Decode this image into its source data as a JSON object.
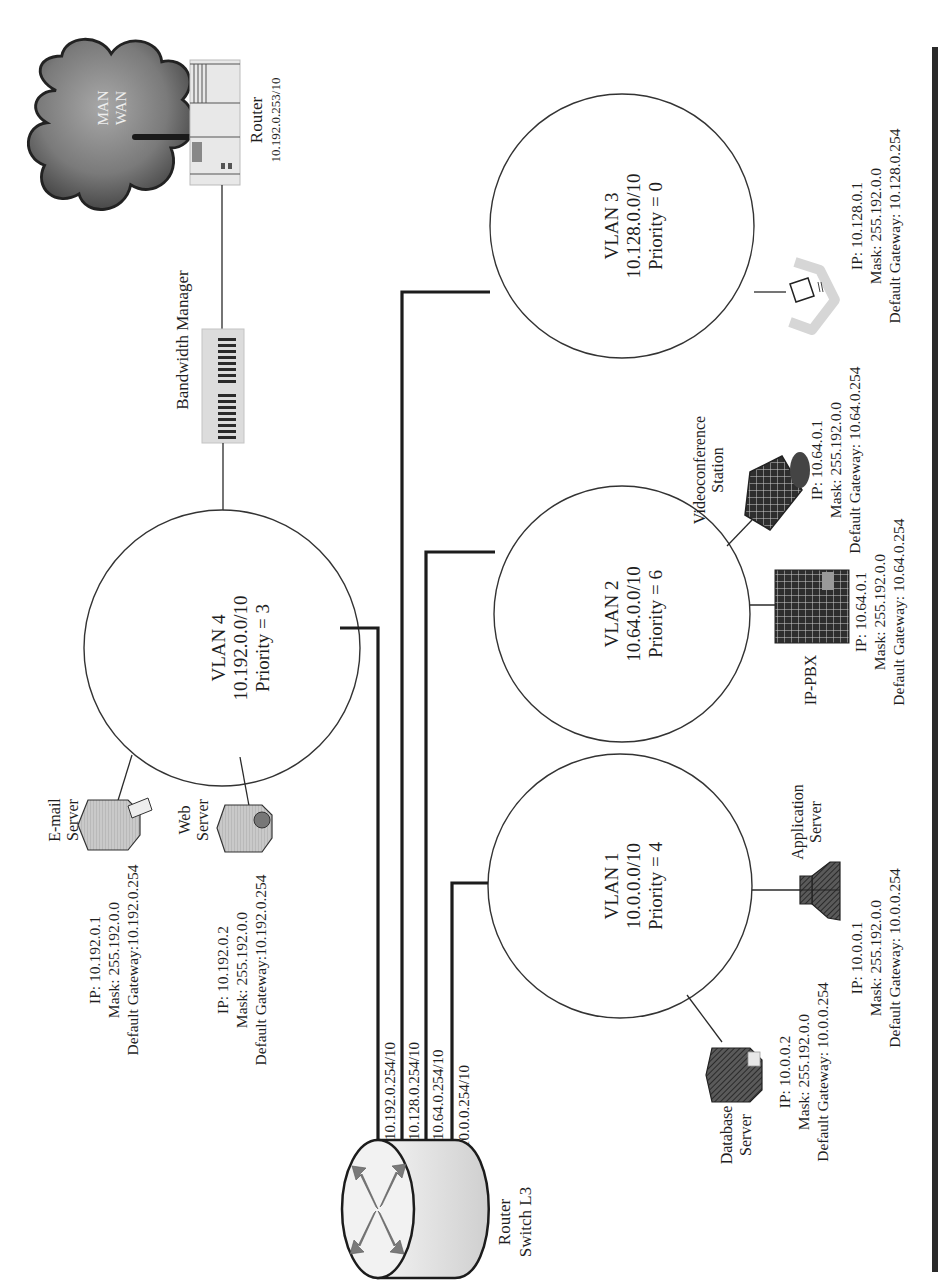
{
  "colors": {
    "line": "#1c1c1c",
    "cloud_dark": "#4a4a4a",
    "cloud_light": "#9a9a9a",
    "device_gray": "#bdbdbd",
    "device_dark": "#3c3c3c",
    "router_fill": "#e6e6e6",
    "arrow_gray": "#7a7a7a"
  },
  "wan": {
    "cloud_label_1": "MAN",
    "cloud_label_2": "WAN",
    "icon": "cloud-icon"
  },
  "edge_router": {
    "name": "Router",
    "ip": "10.192.0.253/10",
    "icon": "router-rack-icon"
  },
  "bandwidth_manager": {
    "name": "Bandwidth Manager",
    "icon": "bandwidth-manager-icon"
  },
  "core_router": {
    "name_line1": "Router",
    "name_line2": "Switch L3",
    "icon": "layer3-switch-icon",
    "ports": [
      {
        "label": "10.192.0.254/10",
        "vlan": "VLAN 4"
      },
      {
        "label": "10.128.0.254/10",
        "vlan": "VLAN 3"
      },
      {
        "label": "10.64.0.254/10",
        "vlan": "VLAN 2"
      },
      {
        "label": "10.0.0.254/10",
        "vlan": "VLAN 1"
      }
    ]
  },
  "vlans": [
    {
      "name": "VLAN 4",
      "network": "10.192.0.0/10",
      "priority": "Priority = 3",
      "devices": [
        {
          "name_line1": "E-mail",
          "name_line2": "Server",
          "icon": "email-server-icon",
          "ip": "IP: 10.192.0.1",
          "mask": "Mask: 255.192.0.0",
          "gateway": "Default Gateway:10.192.0.254"
        },
        {
          "name_line1": "Web",
          "name_line2": "Server",
          "icon": "web-server-icon",
          "ip": "IP: 10.192.0.2",
          "mask": "Mask: 255.192.0.0",
          "gateway": "Default Gateway:10.192.0.254"
        }
      ]
    },
    {
      "name": "VLAN 3",
      "network": "10.128.0.0/10",
      "priority": "Priority = 0",
      "devices": [
        {
          "name_line1": "",
          "name_line2": "",
          "icon": "workstation-icon",
          "ip": "IP: 10.128.0.1",
          "mask": "Mask: 255.192.0.0",
          "gateway": "Default Gateway: 10.128.0.254"
        }
      ]
    },
    {
      "name": "VLAN 2",
      "network": "10.64.0.0/10",
      "priority": "Priority = 6",
      "devices": [
        {
          "name_line1": "IP-PBX",
          "name_line2": "",
          "icon": "ip-pbx-icon",
          "ip": "IP: 10.64.0.1",
          "mask": "Mask: 255.192.0.0",
          "gateway": "Default Gateway: 10.64.0.254"
        },
        {
          "name_line1": "Videoconference",
          "name_line2": "Station",
          "icon": "videoconference-icon",
          "ip": "IP: 10.64.0.1",
          "mask": "Mask: 255.192.0.0",
          "gateway": "Default Gateway: 10.64.0.254"
        }
      ]
    },
    {
      "name": "VLAN 1",
      "network": "10.0.0.0/10",
      "priority": "Priority = 4",
      "devices": [
        {
          "name_line1": "Database",
          "name_line2": "Server",
          "icon": "database-server-icon",
          "ip": "IP: 10.0.0.2",
          "mask": "Mask: 255.192.0.0",
          "gateway": "Default Gateway: 10.0.0.254"
        },
        {
          "name_line1": "Application",
          "name_line2": "Server",
          "icon": "application-server-icon",
          "ip": "IP: 10.0.0.1",
          "mask": "Mask: 255.192.0.0",
          "gateway": "Default Gateway: 10.0.0.254"
        }
      ]
    }
  ]
}
